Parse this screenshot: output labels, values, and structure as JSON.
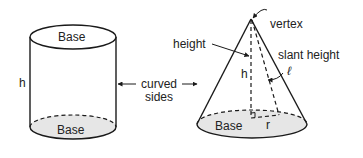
{
  "colors": {
    "stroke": "#1a1a1a",
    "base_fill": "#e6e6e6",
    "background": "#ffffff"
  },
  "cylinder": {
    "top_label": "Base",
    "bottom_label": "Base",
    "height_label": "h"
  },
  "shared": {
    "curved_label_line1": "curved",
    "curved_label_line2": "sides"
  },
  "cone": {
    "vertex_label": "vertex",
    "height_label": "height",
    "h_label": "h",
    "slant_label": "slant height",
    "slant_symbol": "ℓ",
    "base_label": "Base",
    "radius_label": "r"
  }
}
